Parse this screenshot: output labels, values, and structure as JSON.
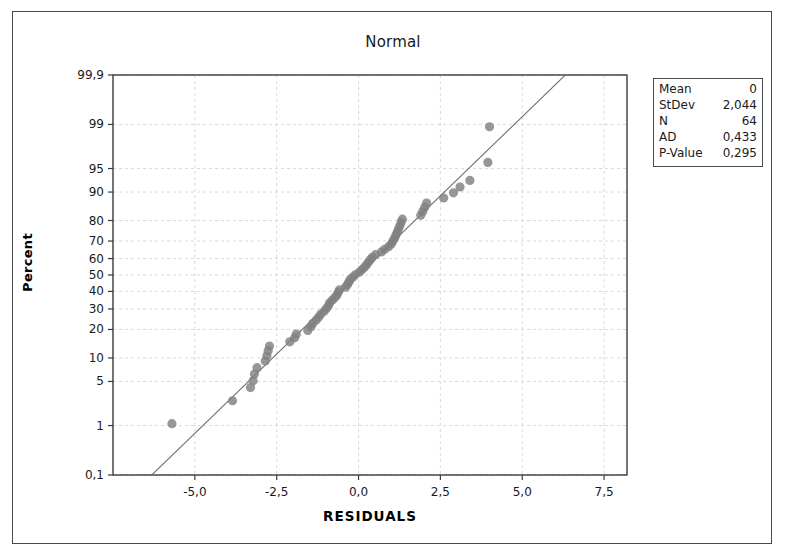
{
  "figure": {
    "title": "Normal",
    "background": "#ffffff",
    "frame_color": "#4a4a4a"
  },
  "legend": {
    "name": "statistics-box",
    "rows": [
      {
        "label": "Mean",
        "value": "0"
      },
      {
        "label": "StDev",
        "value": "2,044"
      },
      {
        "label": "N",
        "value": "64"
      },
      {
        "label": "AD",
        "value": "0,433"
      },
      {
        "label": "P-Value",
        "value": "0,295"
      }
    ]
  },
  "chart_data": {
    "type": "scatter",
    "title": "Normal",
    "xlabel": "RESIDUALS",
    "ylabel": "Percent",
    "grid": true,
    "legend_position": "right-outside",
    "marker_color": "#808080",
    "line_color": "#6e6e6e",
    "grid_color": "#cfcfcf",
    "xlim": [
      -7.5,
      8.2
    ],
    "xticks": [
      -5.0,
      -2.5,
      0.0,
      2.5,
      5.0,
      7.5
    ],
    "xticklabels": [
      "-5,0",
      "-2,5",
      "0,0",
      "2,5",
      "5,0",
      "7,5"
    ],
    "ylim_percent": [
      0.1,
      99.9
    ],
    "yticks": [
      0.1,
      1,
      5,
      10,
      20,
      30,
      40,
      50,
      60,
      70,
      80,
      90,
      95,
      99,
      99.9
    ],
    "yticklabels": [
      "0,1",
      "1",
      "5",
      "10",
      "20",
      "30",
      "40",
      "50",
      "60",
      "70",
      "80",
      "90",
      "95",
      "99",
      "99,9"
    ],
    "fit_line": {
      "mean": 0,
      "stdev": 2.044
    },
    "stats": {
      "mean": 0,
      "stdev": 2.044,
      "n": 64,
      "ad": 0.433,
      "p_value": 0.295
    },
    "points": [
      {
        "x": -5.7,
        "p": 1.08
      },
      {
        "x": -3.85,
        "p": 2.6
      },
      {
        "x": -3.3,
        "p": 4.1
      },
      {
        "x": -3.22,
        "p": 5.1
      },
      {
        "x": -3.18,
        "p": 6.3
      },
      {
        "x": -3.1,
        "p": 7.6
      },
      {
        "x": -2.85,
        "p": 9.2
      },
      {
        "x": -2.8,
        "p": 10.6
      },
      {
        "x": -2.76,
        "p": 12.1
      },
      {
        "x": -2.72,
        "p": 13.6
      },
      {
        "x": -2.1,
        "p": 15.1
      },
      {
        "x": -1.95,
        "p": 16.6
      },
      {
        "x": -1.9,
        "p": 18.1
      },
      {
        "x": -1.55,
        "p": 19.6
      },
      {
        "x": -1.45,
        "p": 21.2
      },
      {
        "x": -1.4,
        "p": 22.7
      },
      {
        "x": -1.3,
        "p": 24.2
      },
      {
        "x": -1.22,
        "p": 25.7
      },
      {
        "x": -1.15,
        "p": 27.3
      },
      {
        "x": -1.05,
        "p": 28.8
      },
      {
        "x": -0.98,
        "p": 30.3
      },
      {
        "x": -0.92,
        "p": 31.8
      },
      {
        "x": -0.88,
        "p": 33.4
      },
      {
        "x": -0.8,
        "p": 34.9
      },
      {
        "x": -0.72,
        "p": 36.4
      },
      {
        "x": -0.66,
        "p": 37.9
      },
      {
        "x": -0.62,
        "p": 39.5
      },
      {
        "x": -0.58,
        "p": 41.0
      },
      {
        "x": -0.4,
        "p": 42.5
      },
      {
        "x": -0.34,
        "p": 44.0
      },
      {
        "x": -0.3,
        "p": 45.6
      },
      {
        "x": -0.26,
        "p": 47.1
      },
      {
        "x": -0.18,
        "p": 48.6
      },
      {
        "x": -0.1,
        "p": 50.1
      },
      {
        "x": 0.02,
        "p": 51.7
      },
      {
        "x": 0.1,
        "p": 53.2
      },
      {
        "x": 0.18,
        "p": 54.7
      },
      {
        "x": 0.24,
        "p": 56.2
      },
      {
        "x": 0.3,
        "p": 57.8
      },
      {
        "x": 0.36,
        "p": 59.3
      },
      {
        "x": 0.42,
        "p": 60.8
      },
      {
        "x": 0.52,
        "p": 62.3
      },
      {
        "x": 0.7,
        "p": 63.9
      },
      {
        "x": 0.8,
        "p": 65.4
      },
      {
        "x": 0.92,
        "p": 66.9
      },
      {
        "x": 1.0,
        "p": 68.4
      },
      {
        "x": 1.05,
        "p": 70.0
      },
      {
        "x": 1.1,
        "p": 71.5
      },
      {
        "x": 1.14,
        "p": 73.0
      },
      {
        "x": 1.18,
        "p": 74.5
      },
      {
        "x": 1.22,
        "p": 76.1
      },
      {
        "x": 1.26,
        "p": 77.6
      },
      {
        "x": 1.3,
        "p": 79.1
      },
      {
        "x": 1.34,
        "p": 80.6
      },
      {
        "x": 1.9,
        "p": 82.2
      },
      {
        "x": 1.96,
        "p": 83.7
      },
      {
        "x": 2.02,
        "p": 85.2
      },
      {
        "x": 2.08,
        "p": 86.7
      },
      {
        "x": 2.6,
        "p": 88.3
      },
      {
        "x": 2.9,
        "p": 89.8
      },
      {
        "x": 3.1,
        "p": 91.3
      },
      {
        "x": 3.4,
        "p": 92.8
      },
      {
        "x": 3.95,
        "p": 95.9
      },
      {
        "x": 4.0,
        "p": 98.9
      }
    ]
  }
}
